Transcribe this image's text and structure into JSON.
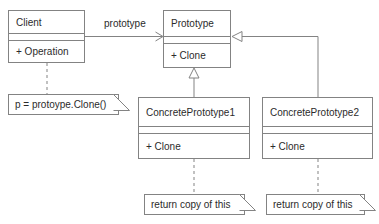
{
  "diagram": {
    "stroke_color": "#838383",
    "text_color": "#2b2b2b",
    "background_color": "#ffffff"
  },
  "classes": [
    {
      "id": "client",
      "name": "Client",
      "operations": "+ Operation",
      "x": 8,
      "y": 10,
      "w": 77,
      "h": 53,
      "name_h": 23,
      "attrs_h": 7
    },
    {
      "id": "prototype",
      "name": "Prototype",
      "operations": "+ Clone",
      "x": 163,
      "y": 10,
      "w": 68,
      "h": 58,
      "name_h": 26,
      "attrs_h": 7
    },
    {
      "id": "concrete-prototype-1",
      "name": "ConcretePrototype1",
      "operations": "+ Clone",
      "x": 138,
      "y": 97,
      "w": 112,
      "h": 62,
      "name_h": 29,
      "attrs_h": 7
    },
    {
      "id": "concrete-prototype-2",
      "name": "ConcretePrototype2",
      "operations": "+ Clone",
      "x": 262,
      "y": 97,
      "w": 111,
      "h": 62,
      "name_h": 29,
      "attrs_h": 7
    }
  ],
  "notes": [
    {
      "id": "client-note",
      "text": "p = protoype.Clone()",
      "x": 8,
      "y": 94,
      "w": 122,
      "h": 21
    },
    {
      "id": "concrete-prototype-1-note",
      "text": "return copy of this",
      "x": 144,
      "y": 194,
      "w": 112,
      "h": 21
    },
    {
      "id": "concrete-prototype-2-note",
      "text": "return copy of this",
      "x": 266,
      "y": 194,
      "w": 110,
      "h": 21
    }
  ],
  "relationships": [
    {
      "id": "client-uses-prototype",
      "type": "association",
      "label": "prototype",
      "from": "client",
      "to": "prototype",
      "label_x": 102,
      "label_y": 23
    },
    {
      "id": "concrete-prototype-1-inherits",
      "type": "generalization",
      "label": "",
      "from": "concrete-prototype-1",
      "to": "prototype"
    },
    {
      "id": "concrete-prototype-2-inherits",
      "type": "generalization",
      "label": "",
      "from": "concrete-prototype-2",
      "to": "prototype"
    },
    {
      "id": "client-note-link",
      "type": "note-anchor",
      "label": "",
      "from": "client",
      "to": "client-note"
    },
    {
      "id": "concrete-prototype-1-note-link",
      "type": "note-anchor",
      "label": "",
      "from": "concrete-prototype-1",
      "to": "concrete-prototype-1-note"
    },
    {
      "id": "concrete-prototype-2-note-link",
      "type": "note-anchor",
      "label": "",
      "from": "concrete-prototype-2",
      "to": "concrete-prototype-2-note"
    }
  ]
}
